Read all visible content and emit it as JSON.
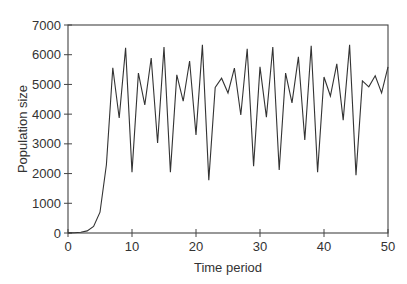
{
  "chart_data": {
    "type": "line",
    "title": "",
    "xlabel": "Time period",
    "ylabel": "Population size",
    "xlim": [
      0,
      50
    ],
    "ylim": [
      0,
      7000
    ],
    "x_ticks": [
      0,
      10,
      20,
      30,
      40,
      50
    ],
    "y_ticks": [
      0,
      1000,
      2000,
      3000,
      4000,
      5000,
      6000,
      7000
    ],
    "grid": false,
    "legend": null,
    "series": [
      {
        "name": "Population size",
        "color": "#333333",
        "x": [
          0,
          1,
          2,
          3,
          4,
          5,
          6,
          7,
          8,
          9,
          10,
          11,
          12,
          13,
          14,
          15,
          16,
          17,
          18,
          19,
          20,
          21,
          22,
          23,
          24,
          25,
          26,
          27,
          28,
          29,
          30,
          31,
          32,
          33,
          34,
          35,
          36,
          37,
          38,
          39,
          40,
          41,
          42,
          43,
          44,
          45,
          46,
          47,
          48,
          49,
          50
        ],
        "values": [
          5,
          10,
          25,
          70,
          220,
          700,
          2300,
          5560,
          3870,
          6230,
          2050,
          5380,
          4310,
          5890,
          3030,
          6260,
          2050,
          5320,
          4440,
          5790,
          3300,
          6330,
          1780,
          4900,
          5210,
          4710,
          5550,
          3970,
          6200,
          2250,
          5590,
          3900,
          6260,
          2120,
          5380,
          4380,
          5930,
          3130,
          6300,
          2050,
          5250,
          4610,
          5690,
          3800,
          6330,
          1950,
          5120,
          4920,
          5290,
          4710,
          5590
        ]
      }
    ]
  }
}
